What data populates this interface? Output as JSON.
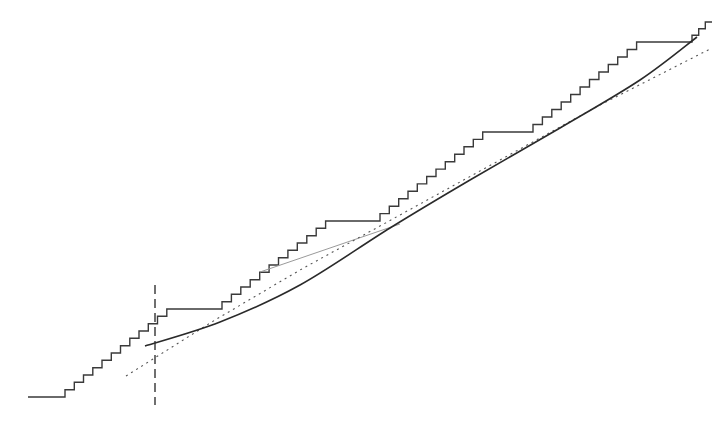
{
  "chart_data": {
    "type": "line",
    "title": "",
    "xlabel": "",
    "ylabel": "",
    "grid": false,
    "legend": null,
    "axes_visible": false,
    "colors": {
      "staircase": "#3a3a3a",
      "smooth_curve": "#2a2a2a",
      "dotted_line": "#555555",
      "secondary_faint": "#9a9a9a",
      "vertical_marker": "#333333"
    },
    "series": [
      {
        "name": "staircase",
        "style": "solid-step",
        "segments": [
          {
            "kind": "lead-in",
            "from": [
              28,
              397
            ],
            "to": [
              65,
              397
            ]
          },
          {
            "kind": "steps",
            "x_start": 65,
            "x_end": 176,
            "y_start": 397,
            "y_end": 309,
            "count": 12
          },
          {
            "kind": "flat",
            "from": [
              178,
              309
            ],
            "to": [
              222,
              309
            ]
          },
          {
            "kind": "steps",
            "x_start": 222,
            "x_end": 335,
            "y_start": 309,
            "y_end": 221,
            "count": 12
          },
          {
            "kind": "flat",
            "from": [
              335,
              221
            ],
            "to": [
              380,
              221
            ]
          },
          {
            "kind": "steps",
            "x_start": 380,
            "x_end": 492,
            "y_start": 221,
            "y_end": 132,
            "count": 12
          },
          {
            "kind": "flat",
            "from": [
              492,
              132
            ],
            "to": [
              533,
              132
            ]
          },
          {
            "kind": "steps",
            "x_start": 533,
            "x_end": 646,
            "y_start": 132,
            "y_end": 42,
            "count": 12
          },
          {
            "kind": "flat",
            "from": [
              646,
              42
            ],
            "to": [
              692,
              42
            ]
          },
          {
            "kind": "steps",
            "x_start": 692,
            "x_end": 712,
            "y_start": 42,
            "y_end": 22,
            "count": 3
          }
        ]
      },
      {
        "name": "smooth-curve",
        "style": "solid",
        "points": [
          [
            145,
            346
          ],
          [
            220,
            322
          ],
          [
            300,
            285
          ],
          [
            390,
            228
          ],
          [
            470,
            180
          ],
          [
            560,
            128
          ],
          [
            640,
            80
          ],
          [
            697,
            37
          ]
        ]
      },
      {
        "name": "dotted-line",
        "style": "dotted",
        "points": [
          [
            126,
            376
          ],
          [
            215,
            320
          ],
          [
            300,
            270
          ],
          [
            400,
            215
          ],
          [
            500,
            160
          ],
          [
            600,
            105
          ],
          [
            712,
            48
          ]
        ]
      },
      {
        "name": "faint-line",
        "style": "faint",
        "points": [
          [
            260,
            272
          ],
          [
            330,
            248
          ],
          [
            400,
            224
          ]
        ]
      },
      {
        "name": "vertical-marker",
        "style": "dashed",
        "points": [
          [
            155,
            285
          ],
          [
            155,
            405
          ]
        ]
      }
    ]
  }
}
